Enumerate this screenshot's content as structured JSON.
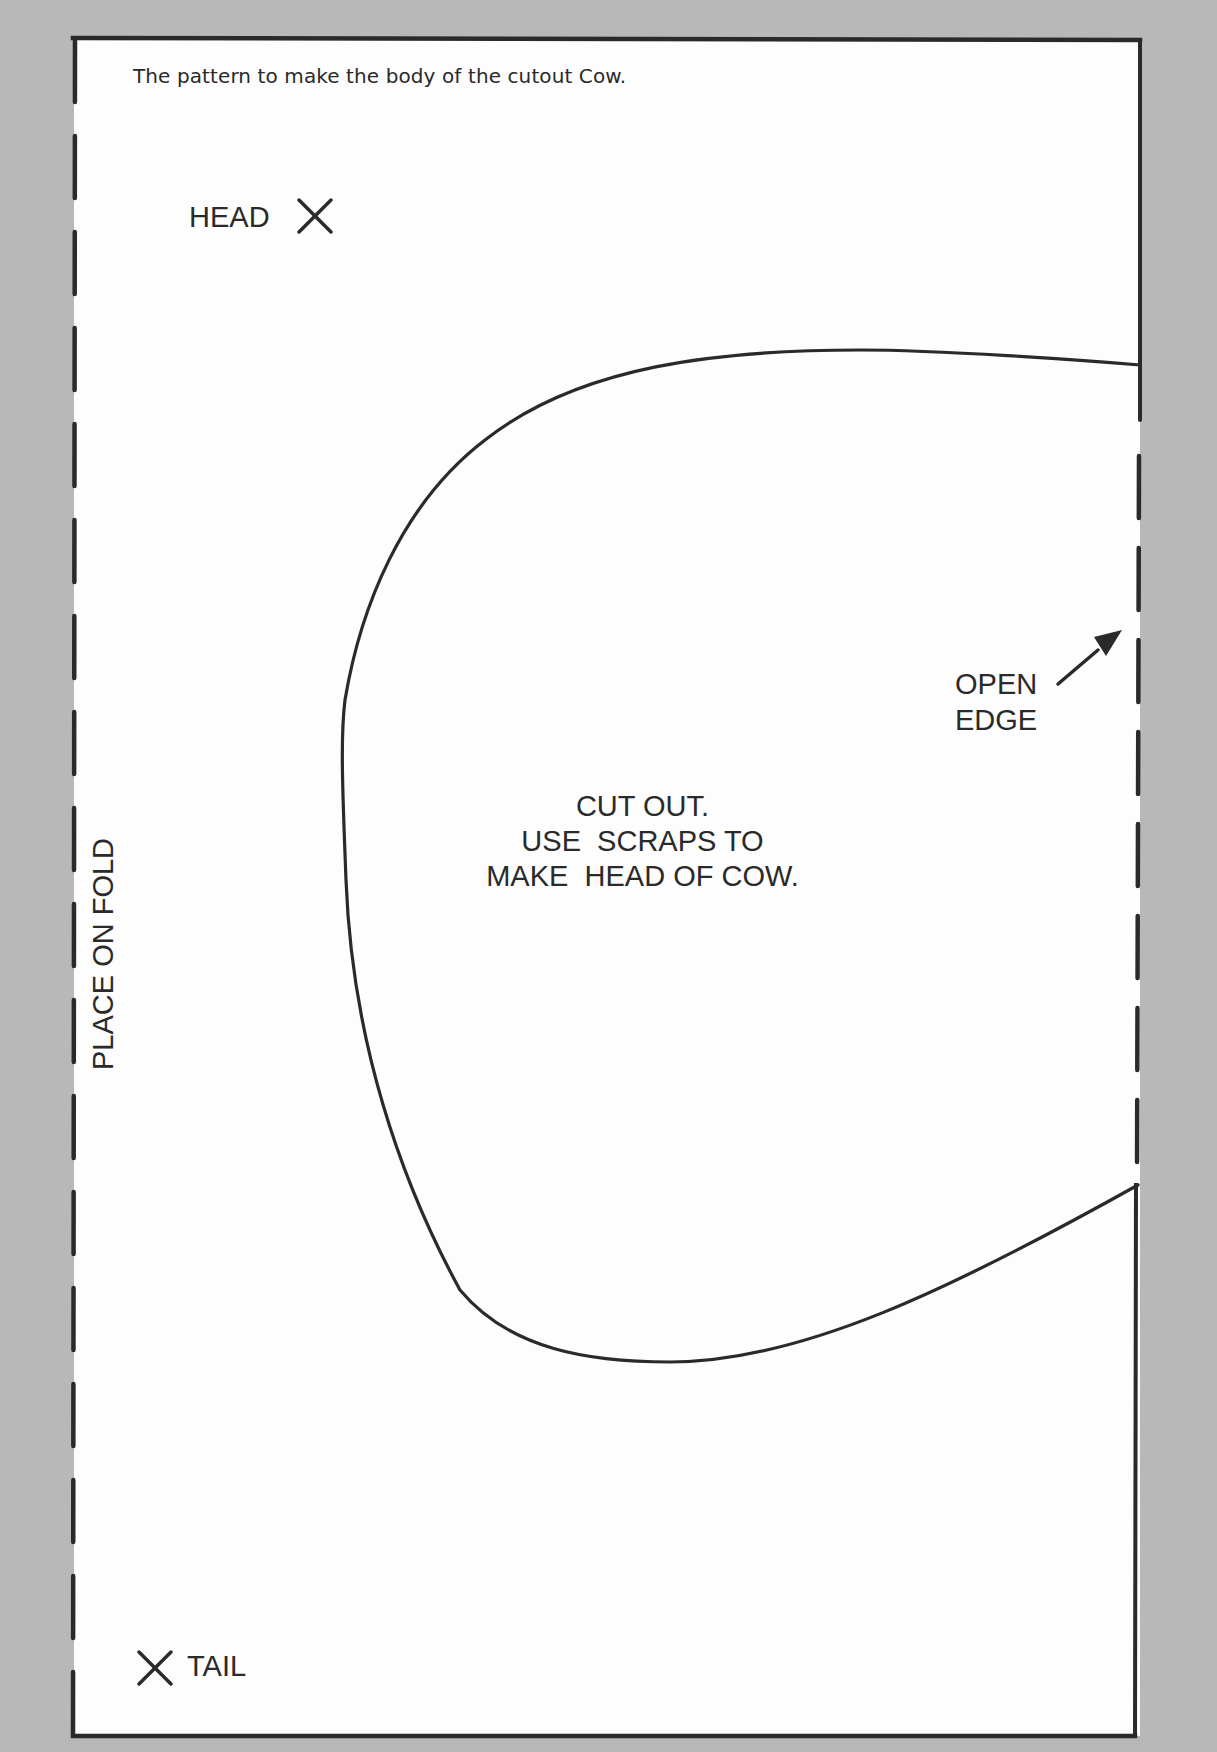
{
  "document": {
    "caption": "The pattern to make the body of the cutout Cow.",
    "markers": {
      "head": {
        "label": "HEAD",
        "icon": "x-mark-icon"
      },
      "tail": {
        "label": "TAIL",
        "icon": "x-mark-icon"
      }
    },
    "open_edge": {
      "line1": "OPEN",
      "line2": "EDGE",
      "icon": "arrow-up-right-icon"
    },
    "instructions": {
      "line1": "CUT OUT.",
      "line2": "USE  SCRAPS TO",
      "line3": "MAKE  HEAD OF COW."
    },
    "fold_label": "PLACE ON FOLD"
  },
  "colors": {
    "background": "#b8b8b8",
    "paper": "#fdfdfd",
    "ink": "#2a2a2a"
  }
}
